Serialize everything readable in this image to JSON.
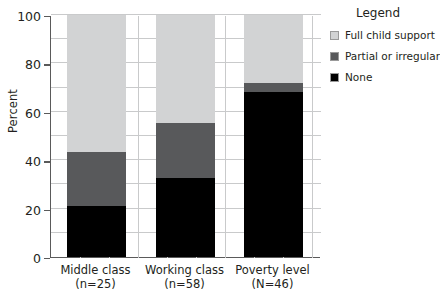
{
  "chart_data": {
    "type": "bar",
    "subtype": "stacked-bar-100-percent",
    "title": "",
    "xlabel": "",
    "ylabel": "Percent",
    "ylim": [
      0,
      100
    ],
    "yticks": [
      0,
      20,
      40,
      60,
      80,
      100
    ],
    "ytick_labels": [
      "0",
      "20",
      "40",
      "60",
      "80",
      "100"
    ],
    "minor_gridline_step": 10,
    "grid": true,
    "legend_position": "right",
    "legend_title": "Legend",
    "categories": [
      "Middle class",
      "Working class",
      "Poverty level"
    ],
    "category_sublabels": [
      "(n=25)",
      "(n=58)",
      "(N=46)"
    ],
    "series": [
      {
        "name": "Full child support",
        "color": "#d2d3d4",
        "values": [
          56.5,
          44.5,
          28.0
        ]
      },
      {
        "name": "Partial or irregular",
        "color": "#58595b",
        "values": [
          22.5,
          23.0,
          4.0
        ]
      },
      {
        "name": "None",
        "color": "#000000",
        "values": [
          21.0,
          32.5,
          68.0
        ]
      }
    ],
    "stack_order_bottom_to_top": [
      "None",
      "Partial or irregular",
      "Full child support"
    ],
    "cumulative_boundaries": {
      "Middle class": [
        21.0,
        43.5,
        100.0
      ],
      "Working class": [
        32.5,
        55.5,
        100.0
      ],
      "Poverty level": [
        68.0,
        72.0,
        100.0
      ]
    },
    "axis_color": "#5a5a5a",
    "grid_color": "#c9cacb",
    "background": "#ffffff"
  }
}
